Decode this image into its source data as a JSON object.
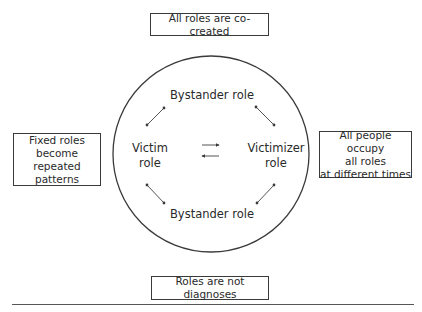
{
  "diagram": {
    "type": "role-cycle",
    "boxes": {
      "top": "All roles are co-created",
      "left": "Fixed roles\nbecome repeated\npatterns",
      "right": "All people occupy\nall roles\nat different times",
      "bottom": "Roles are not diagnoses"
    },
    "circle_roles": {
      "top": "Bystander role",
      "left": "Victim\nrole",
      "right": "Victimizer\nrole",
      "bottom": "Bystander role"
    },
    "arrows": [
      {
        "from": "victim",
        "to": "bystander-top",
        "style": "double-headed"
      },
      {
        "from": "bystander-top",
        "to": "victimizer",
        "style": "double-headed"
      },
      {
        "from": "victim",
        "to": "bystander-bottom",
        "style": "double-headed"
      },
      {
        "from": "bystander-bottom",
        "to": "victimizer",
        "style": "double-headed"
      },
      {
        "from": "victim",
        "to": "victimizer",
        "style": "single-right"
      },
      {
        "from": "victimizer",
        "to": "victim",
        "style": "single-left"
      }
    ],
    "colors": {
      "stroke": "#3a3a3a",
      "text": "#2a2a2a",
      "background": "#ffffff"
    }
  }
}
